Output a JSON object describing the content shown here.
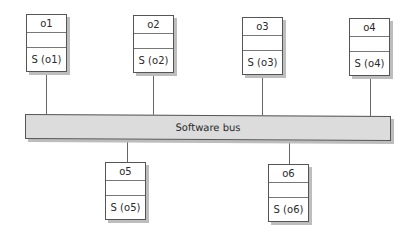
{
  "diagram": {
    "bus": {
      "label": "Software bus",
      "fill": "#dcdcdc"
    },
    "objects": [
      {
        "name": "o1",
        "service": "S (o1)"
      },
      {
        "name": "o2",
        "service": "S (o2)"
      },
      {
        "name": "o3",
        "service": "S (o3)"
      },
      {
        "name": "o4",
        "service": "S (o4)"
      },
      {
        "name": "o5",
        "service": "S (o5)"
      },
      {
        "name": "o6",
        "service": "S (o6)"
      }
    ]
  }
}
